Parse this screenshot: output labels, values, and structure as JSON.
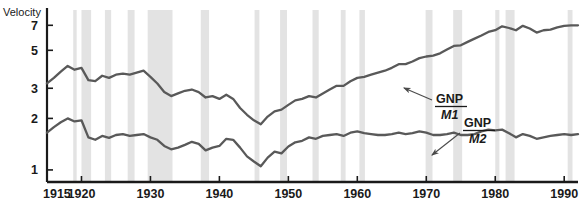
{
  "chart_data": {
    "type": "line",
    "title": "",
    "ylabel": "Velocity",
    "xlabel": "",
    "yscale": "log",
    "ylim": [
      0.85,
      8.6
    ],
    "xlim": [
      1915,
      1992
    ],
    "grid": false,
    "legend_position": "inline-annotations",
    "yticks": [
      1,
      2,
      3,
      5,
      7
    ],
    "ytick_labels": [
      "1",
      "2",
      "3",
      "5",
      "7"
    ],
    "xticks": [
      1915,
      1920,
      1930,
      1940,
      1950,
      1960,
      1970,
      1980,
      1990
    ],
    "xtick_labels": [
      "1915",
      "1920",
      "1930",
      "1940",
      "1950",
      "1960",
      "1970",
      "1980",
      "1990"
    ],
    "annotations": [
      {
        "name": "gnp-m1-label",
        "numerator": "GNP",
        "denominator": "M1",
        "text_x": 436,
        "text_y": 103,
        "arrow_from_x": 432,
        "arrow_from_y": 100,
        "arrow_to_x": 404,
        "arrow_to_y": 88
      },
      {
        "name": "gnp-m2-label",
        "numerator": "GNP",
        "denominator": "M2",
        "text_x": 464,
        "text_y": 127,
        "arrow_from_x": 460,
        "arrow_from_y": 133,
        "arrow_to_x": 432,
        "arrow_to_y": 155
      }
    ],
    "recession_bands": [
      {
        "start": 1918.8,
        "end": 1919.3
      },
      {
        "start": 1920.0,
        "end": 1921.4
      },
      {
        "start": 1923.4,
        "end": 1924.3
      },
      {
        "start": 1926.7,
        "end": 1927.7
      },
      {
        "start": 1929.6,
        "end": 1933.2
      },
      {
        "start": 1937.3,
        "end": 1938.5
      },
      {
        "start": 1945.1,
        "end": 1945.8
      },
      {
        "start": 1948.8,
        "end": 1949.8
      },
      {
        "start": 1953.5,
        "end": 1954.4
      },
      {
        "start": 1957.6,
        "end": 1958.3
      },
      {
        "start": 1960.3,
        "end": 1961.1
      },
      {
        "start": 1969.9,
        "end": 1970.9
      },
      {
        "start": 1973.9,
        "end": 1975.2
      },
      {
        "start": 1980.0,
        "end": 1980.6
      },
      {
        "start": 1981.5,
        "end": 1982.8
      },
      {
        "start": 1990.5,
        "end": 1991.2
      }
    ],
    "series": [
      {
        "name": "GNP/M1",
        "color": "#595959",
        "x": [
          1915,
          1916,
          1917,
          1918,
          1919,
          1920,
          1921,
          1922,
          1923,
          1924,
          1925,
          1926,
          1927,
          1928,
          1929,
          1930,
          1931,
          1932,
          1933,
          1934,
          1935,
          1936,
          1937,
          1938,
          1939,
          1940,
          1941,
          1942,
          1943,
          1944,
          1945,
          1946,
          1947,
          1948,
          1949,
          1950,
          1951,
          1952,
          1953,
          1954,
          1955,
          1956,
          1957,
          1958,
          1959,
          1960,
          1961,
          1962,
          1963,
          1964,
          1965,
          1966,
          1967,
          1968,
          1969,
          1970,
          1971,
          1972,
          1973,
          1974,
          1975,
          1976,
          1977,
          1978,
          1979,
          1980,
          1981,
          1982,
          1983,
          1984,
          1985,
          1986,
          1987,
          1988,
          1989,
          1990,
          1991,
          1992
        ],
        "y": [
          3.2,
          3.45,
          3.75,
          4.05,
          3.85,
          3.95,
          3.35,
          3.3,
          3.55,
          3.45,
          3.6,
          3.65,
          3.6,
          3.7,
          3.8,
          3.5,
          3.2,
          2.85,
          2.7,
          2.8,
          2.9,
          2.95,
          2.85,
          2.65,
          2.7,
          2.6,
          2.75,
          2.6,
          2.3,
          2.1,
          1.95,
          1.85,
          2.05,
          2.2,
          2.25,
          2.4,
          2.55,
          2.6,
          2.7,
          2.65,
          2.8,
          2.95,
          3.1,
          3.1,
          3.3,
          3.45,
          3.5,
          3.6,
          3.7,
          3.8,
          3.95,
          4.15,
          4.15,
          4.3,
          4.5,
          4.6,
          4.65,
          4.8,
          5.05,
          5.3,
          5.35,
          5.6,
          5.85,
          6.1,
          6.4,
          6.55,
          6.9,
          6.75,
          6.55,
          6.95,
          6.7,
          6.35,
          6.55,
          6.6,
          6.8,
          6.95,
          7.0,
          7.0
        ]
      },
      {
        "name": "GNP/M2",
        "color": "#595959",
        "x": [
          1915,
          1916,
          1917,
          1918,
          1919,
          1920,
          1921,
          1922,
          1923,
          1924,
          1925,
          1926,
          1927,
          1928,
          1929,
          1930,
          1931,
          1932,
          1933,
          1934,
          1935,
          1936,
          1937,
          1938,
          1939,
          1940,
          1941,
          1942,
          1943,
          1944,
          1945,
          1946,
          1947,
          1948,
          1949,
          1950,
          1951,
          1952,
          1953,
          1954,
          1955,
          1956,
          1957,
          1958,
          1959,
          1960,
          1961,
          1962,
          1963,
          1964,
          1965,
          1966,
          1967,
          1968,
          1969,
          1970,
          1971,
          1972,
          1973,
          1974,
          1975,
          1976,
          1977,
          1978,
          1979,
          1980,
          1981,
          1982,
          1983,
          1984,
          1985,
          1986,
          1987,
          1988,
          1989,
          1990,
          1991,
          1992
        ],
        "y": [
          1.65,
          1.78,
          1.9,
          2.0,
          1.92,
          1.95,
          1.55,
          1.5,
          1.58,
          1.54,
          1.6,
          1.62,
          1.58,
          1.6,
          1.62,
          1.55,
          1.5,
          1.38,
          1.32,
          1.35,
          1.4,
          1.46,
          1.42,
          1.3,
          1.35,
          1.38,
          1.52,
          1.5,
          1.35,
          1.2,
          1.12,
          1.05,
          1.18,
          1.28,
          1.25,
          1.37,
          1.45,
          1.48,
          1.55,
          1.52,
          1.58,
          1.6,
          1.62,
          1.58,
          1.65,
          1.68,
          1.64,
          1.62,
          1.6,
          1.6,
          1.62,
          1.65,
          1.62,
          1.64,
          1.68,
          1.65,
          1.6,
          1.6,
          1.62,
          1.65,
          1.6,
          1.6,
          1.62,
          1.68,
          1.72,
          1.7,
          1.72,
          1.64,
          1.55,
          1.62,
          1.58,
          1.52,
          1.55,
          1.58,
          1.6,
          1.62,
          1.6,
          1.62
        ]
      }
    ]
  },
  "colors": {
    "band": "#e3e3e3",
    "line": "#595959",
    "axis": "#1a1a1a",
    "text": "#1a1a1a"
  },
  "layout": {
    "plot_left": 47,
    "plot_right": 578,
    "plot_top": 10,
    "plot_bottom": 182
  }
}
